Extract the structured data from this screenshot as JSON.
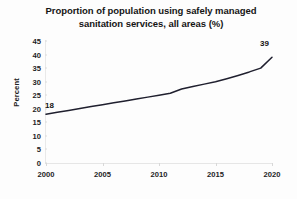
{
  "chart_data": {
    "type": "line",
    "title": "Proportion of population using safely managed sanitation services, all areas (%)",
    "title_line_1": "Proportion of population using safely managed",
    "title_line_2": "sanitation services, all areas (%)",
    "xlabel": "",
    "ylabel": "Percent",
    "xlim": [
      2000,
      2020
    ],
    "ylim": [
      0,
      45
    ],
    "ytick_labels": [
      "45",
      "40",
      "35",
      "30",
      "25",
      "20",
      "15",
      "10",
      "5",
      "0"
    ],
    "ytick_values": [
      45,
      40,
      35,
      30,
      25,
      20,
      15,
      10,
      5,
      0
    ],
    "xtick_labels": [
      "2000",
      "2005",
      "2010",
      "2015",
      "2020"
    ],
    "xtick_values": [
      2000,
      2005,
      2010,
      2015,
      2020
    ],
    "grid": false,
    "legend": false,
    "line_color": "#1f1f2e",
    "series": [
      {
        "name": "Safely managed sanitation services, all areas",
        "x": [
          2000,
          2001,
          2002,
          2003,
          2004,
          2005,
          2006,
          2007,
          2008,
          2009,
          2010,
          2011,
          2012,
          2013,
          2014,
          2015,
          2016,
          2017,
          2018,
          2019,
          2020
        ],
        "values": [
          18.0,
          18.7,
          19.4,
          20.1,
          20.8,
          21.5,
          22.2,
          22.9,
          23.6,
          24.3,
          25.0,
          25.7,
          27.3,
          28.2,
          29.1,
          30.0,
          31.1,
          32.3,
          33.6,
          35.0,
          39.0
        ]
      }
    ],
    "annotations": [
      {
        "name": "start-value",
        "text": "18",
        "x": 2000,
        "y": 18
      },
      {
        "name": "end-value",
        "text": "39",
        "x": 2020,
        "y": 39
      }
    ]
  }
}
